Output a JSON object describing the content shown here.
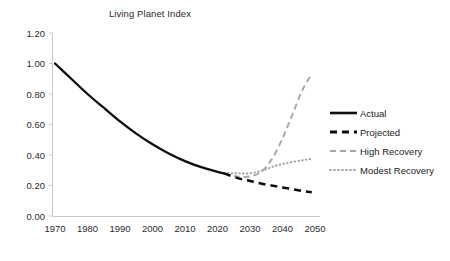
{
  "chart_data": {
    "type": "line",
    "title": "Living Planet Index",
    "xlabel": "",
    "ylabel": "",
    "xlim": [
      1970,
      2052
    ],
    "ylim": [
      0.0,
      1.2
    ],
    "grid": false,
    "legend_position": "right",
    "x_ticks": [
      "1970",
      "1980",
      "1990",
      "2000",
      "2010",
      "2020",
      "2030",
      "2040",
      "2050"
    ],
    "y_ticks": [
      "0.00",
      "0.20",
      "0.40",
      "0.60",
      "0.80",
      "1.00",
      "1.20"
    ],
    "series": [
      {
        "name": "Actual",
        "style": "solid",
        "color": "#0d0d0d",
        "x": [
          1970,
          1975,
          1980,
          1985,
          1990,
          1995,
          2000,
          2005,
          2010,
          2015,
          2020,
          2022
        ],
        "values": [
          1.0,
          0.9,
          0.8,
          0.71,
          0.62,
          0.54,
          0.47,
          0.41,
          0.36,
          0.32,
          0.29,
          0.28
        ]
      },
      {
        "name": "Projected",
        "style": "dashed",
        "color": "#0d0d0d",
        "x": [
          2022,
          2026,
          2030,
          2034,
          2038,
          2042,
          2046,
          2049
        ],
        "values": [
          0.28,
          0.25,
          0.23,
          0.21,
          0.195,
          0.18,
          0.165,
          0.155
        ]
      },
      {
        "name": "High Recovery",
        "style": "dashed-gray",
        "color": "#a6a6a6",
        "x": [
          2022,
          2026,
          2030,
          2034,
          2038,
          2042,
          2046,
          2049
        ],
        "values": [
          0.28,
          0.26,
          0.26,
          0.3,
          0.42,
          0.61,
          0.82,
          0.93
        ]
      },
      {
        "name": "Modest Recovery",
        "style": "dotted-gray",
        "color": "#9e9e9e",
        "x": [
          2022,
          2026,
          2030,
          2034,
          2038,
          2042,
          2046,
          2049
        ],
        "values": [
          0.28,
          0.28,
          0.28,
          0.3,
          0.33,
          0.35,
          0.365,
          0.375
        ]
      }
    ],
    "legend": [
      {
        "label": "Actual"
      },
      {
        "label": "Projected"
      },
      {
        "label": "High Recovery"
      },
      {
        "label": "Modest Recovery"
      }
    ]
  }
}
